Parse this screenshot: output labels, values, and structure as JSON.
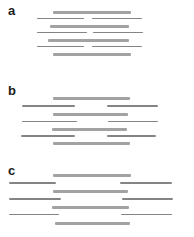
{
  "figure": {
    "colors": {
      "background": "#ffffff",
      "contig_bar": "#a2a2a2",
      "read_line": "#848484",
      "label_text": "#1c1c1c"
    },
    "bar_thickness": {
      "thick": 3.2,
      "thin": 1.6
    },
    "panels": [
      {
        "label": "a",
        "label_pos": {
          "x": 8,
          "y": 4
        },
        "rows": [
          {
            "type": "thick",
            "y": 10.5,
            "segments": [
              {
                "x": 53,
                "w": 78
              }
            ]
          },
          {
            "type": "thin",
            "y": 17.8,
            "segments": [
              {
                "x": 37,
                "w": 47
              },
              {
                "x": 92,
                "w": 50
              }
            ]
          },
          {
            "type": "thick",
            "y": 24.5,
            "segments": [
              {
                "x": 50,
                "w": 79
              }
            ]
          },
          {
            "type": "thin",
            "y": 31.8,
            "segments": [
              {
                "x": 37,
                "w": 50
              },
              {
                "x": 93,
                "w": 50
              }
            ]
          },
          {
            "type": "thick",
            "y": 38.5,
            "segments": [
              {
                "x": 48,
                "w": 81
              }
            ]
          },
          {
            "type": "thin",
            "y": 45.8,
            "segments": [
              {
                "x": 37,
                "w": 47
              },
              {
                "x": 92,
                "w": 50
              }
            ]
          },
          {
            "type": "thick",
            "y": 52.5,
            "segments": [
              {
                "x": 53,
                "w": 78
              }
            ]
          }
        ]
      },
      {
        "label": "b",
        "label_pos": {
          "x": 8,
          "y": 84
        },
        "rows": [
          {
            "type": "thick",
            "y": 97.0,
            "segments": [
              {
                "x": 53,
                "w": 77
              }
            ]
          },
          {
            "type": "thin",
            "y": 105.3,
            "segments": [
              {
                "x": 22,
                "w": 53
              },
              {
                "x": 107,
                "w": 51
              }
            ]
          },
          {
            "type": "thick",
            "y": 113.0,
            "segments": [
              {
                "x": 53,
                "w": 75
              }
            ]
          },
          {
            "type": "thin",
            "y": 120.8,
            "segments": [
              {
                "x": 22,
                "w": 55
              },
              {
                "x": 108,
                "w": 50
              }
            ]
          },
          {
            "type": "thick",
            "y": 127.8,
            "segments": [
              {
                "x": 52,
                "w": 75
              }
            ]
          },
          {
            "type": "thin",
            "y": 135.3,
            "segments": [
              {
                "x": 21,
                "w": 54
              },
              {
                "x": 107,
                "w": 49
              }
            ]
          },
          {
            "type": "thick",
            "y": 142.2,
            "segments": [
              {
                "x": 53,
                "w": 77
              }
            ]
          }
        ]
      },
      {
        "label": "c",
        "label_pos": {
          "x": 8,
          "y": 164
        },
        "rows": [
          {
            "type": "thick",
            "y": 173.5,
            "segments": [
              {
                "x": 53,
                "w": 78
              }
            ]
          },
          {
            "type": "thin",
            "y": 182.3,
            "segments": [
              {
                "x": 9,
                "w": 47
              },
              {
                "x": 120,
                "w": 52
              }
            ]
          },
          {
            "type": "thick",
            "y": 190.0,
            "segments": [
              {
                "x": 53,
                "w": 75
              }
            ]
          },
          {
            "type": "thin",
            "y": 198.3,
            "segments": [
              {
                "x": 9,
                "w": 52
              },
              {
                "x": 122,
                "w": 51
              }
            ]
          },
          {
            "type": "thick",
            "y": 205.8,
            "segments": [
              {
                "x": 52,
                "w": 77
              }
            ]
          },
          {
            "type": "thin",
            "y": 213.8,
            "segments": [
              {
                "x": 9,
                "w": 50
              },
              {
                "x": 121,
                "w": 51
              }
            ]
          },
          {
            "type": "thick",
            "y": 221.5,
            "segments": [
              {
                "x": 55,
                "w": 75
              }
            ]
          }
        ]
      }
    ]
  }
}
